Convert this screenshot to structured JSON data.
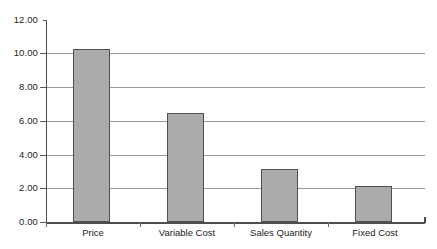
{
  "chart_data": {
    "type": "bar",
    "title": "",
    "subtitle": "",
    "xlabel": "",
    "ylabel": "",
    "categories": [
      "Price",
      "Variable Cost",
      "Sales Quantity",
      "Fixed Cost"
    ],
    "values": [
      10.3,
      6.45,
      3.15,
      2.15
    ],
    "series": [
      {
        "name": "",
        "values": [
          10.3,
          6.45,
          3.15,
          2.15
        ]
      }
    ],
    "ylim": [
      0,
      12
    ],
    "ytick_step": 2,
    "ytick_labels": [
      "0.00",
      "2.00",
      "4.00",
      "6.00",
      "8.00",
      "10.00",
      "12.00"
    ],
    "ytick_values": [
      0,
      2,
      4,
      6,
      8,
      10,
      12
    ],
    "grid": true,
    "grid_axis": "y",
    "legend": false,
    "legend_position": "none",
    "bar_color": "#ababab",
    "bar_border_color": "#4f4f4f",
    "gridline_color": "#9a9a9a",
    "axis_color": "#4d4d4d"
  }
}
